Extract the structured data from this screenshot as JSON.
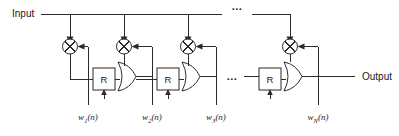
{
  "figure": {
    "input_label": "Input",
    "output_label": "Output",
    "delay_label": "R",
    "ellipsis": "...",
    "ellipsis_top": "...",
    "ellipsis_mid": "...",
    "colors": {
      "line": "#2b2b2b",
      "text": "#1a1a1a",
      "background": "#ffffff"
    },
    "weights": [
      {
        "base": "w",
        "sub": "1",
        "arg": "(n)",
        "full": "w1(n)"
      },
      {
        "base": "w",
        "sub": "2",
        "arg": "(n)",
        "full": "w2(n)"
      },
      {
        "base": "w",
        "sub": "3",
        "arg": "(n)",
        "full": "w3(n)"
      },
      {
        "base": "w",
        "sub": "N",
        "arg": "(n)",
        "full": "wN(n)"
      }
    ],
    "stages": [
      {
        "index": 1,
        "multiplier": "multiply",
        "delay": "R",
        "adder": "sum"
      },
      {
        "index": 2,
        "multiplier": "multiply",
        "delay": "R",
        "adder": "sum"
      },
      {
        "index": 3,
        "multiplier": "multiply",
        "delay": "R",
        "adder": "sum"
      },
      {
        "index": 4,
        "multiplier": "multiply",
        "delay": "R",
        "adder": "sum"
      }
    ]
  }
}
